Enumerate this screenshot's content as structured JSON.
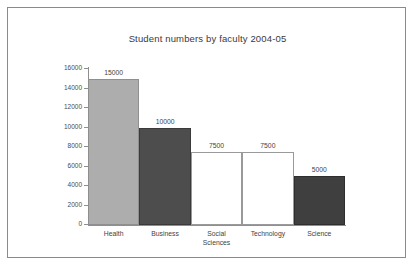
{
  "chart_data": {
    "type": "bar",
    "title": "Student numbers by faculty 2004-05",
    "xlabel": "",
    "ylabel": "",
    "categories": [
      "Health",
      "Business",
      "Social Sciences",
      "Technology",
      "Science"
    ],
    "values": [
      15000,
      10000,
      7500,
      7500,
      5000
    ],
    "value_labels": [
      "15000",
      "10000",
      "7500",
      "7500",
      "5000"
    ],
    "bar_colors": [
      "#adadad",
      "#4d4d4d",
      "#ffffff",
      "#ffffff",
      "#3f3f3f"
    ],
    "bar_edge_colors": [
      "#8f8f8f",
      "#3a3a3a",
      "#9a9a9a",
      "#9a9a9a",
      "#2e2e2e"
    ],
    "ylim": [
      0,
      16000
    ],
    "yticks": [
      0,
      2000,
      4000,
      6000,
      8000,
      10000,
      12000,
      14000,
      16000
    ],
    "ytick_labels": [
      "0",
      "2000",
      "4000",
      "6000",
      "8000",
      "10000",
      "12000",
      "14000",
      "16000"
    ],
    "grid": false,
    "legend": "none",
    "bar_gap": 0
  },
  "figure": {
    "border_color": "#8a8a8a",
    "background": "#ffffff",
    "axis_color": "#8f8f8f",
    "text_color": "#3f3f3f"
  }
}
